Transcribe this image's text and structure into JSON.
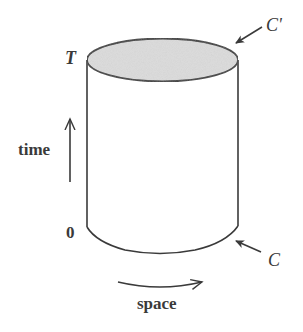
{
  "diagram": {
    "labels": {
      "top_time": "T",
      "bottom_time": "0",
      "time_axis": "time",
      "space_axis": "space",
      "top_curve": "C'",
      "bottom_curve": "C"
    },
    "colors": {
      "stroke": "#3a3a3a",
      "lid_fill": "#dcdcdc",
      "background": "#ffffff"
    },
    "elements": [
      {
        "id": "cylinder-top-ellipse",
        "description": "Shaded top cap of cylinder at time T, curve C'"
      },
      {
        "id": "cylinder-body",
        "description": "Vertical sides of cylinder from time 0 to T"
      },
      {
        "id": "cylinder-bottom-curve",
        "description": "Bottom front arc at time 0, curve C"
      },
      {
        "id": "time-arrow",
        "description": "Upward arrow indicating time direction"
      },
      {
        "id": "space-arrow",
        "description": "Curved rightward arrow indicating spatial direction"
      },
      {
        "id": "c-prime-pointer",
        "description": "Arrow pointing to top curve C'"
      },
      {
        "id": "c-pointer",
        "description": "Arrow pointing to bottom curve C"
      }
    ]
  }
}
